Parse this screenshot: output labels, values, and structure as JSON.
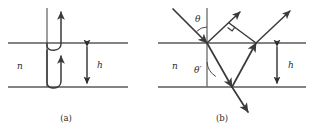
{
  "figure": {
    "panels": [
      {
        "id": "a",
        "caption": "(a)",
        "caption_x": 66,
        "caption_y": 121,
        "medium_label": "n",
        "medium_label_x": 17,
        "medium_label_y": 69,
        "thickness_label": "h",
        "thickness_label_x": 97,
        "thickness_label_y": 68,
        "top_interface_y": 43,
        "bottom_interface_y": 87,
        "line_x_start": 8,
        "line_x_end": 128,
        "normal_x": 47,
        "dim_x": 87
      },
      {
        "id": "b",
        "caption": "(b)",
        "caption_x": 222,
        "caption_y": 121,
        "medium_label": "n",
        "medium_label_x": 172,
        "medium_label_y": 69,
        "thickness_label": "h",
        "thickness_label_x": 288,
        "thickness_label_y": 68,
        "incidence_angle_label": "θ",
        "incidence_angle_label_x": 198,
        "incidence_angle_label_y": 22,
        "refraction_angle_label": "θ′",
        "refraction_angle_label_x": 197,
        "refraction_angle_label_y": 72,
        "top_interface_y": 43,
        "bottom_interface_y": 87,
        "line_x_start": 158,
        "line_x_end": 306,
        "normal_x": 207,
        "dim_x": 277,
        "vertex_top_x": 207,
        "vertex_bottom_x": 232,
        "vertex_top2_x": 256
      }
    ],
    "colors": {
      "interface": "#5a5a5a",
      "ray": "#3a3a3a",
      "normal": "#6a6a6a",
      "text": "#2b2b2b",
      "background": "#ffffff"
    }
  }
}
